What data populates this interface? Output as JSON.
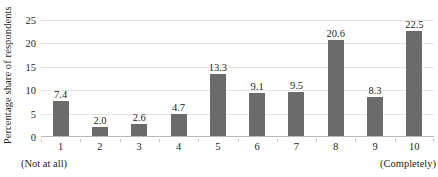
{
  "chart_data": {
    "type": "bar",
    "title": "",
    "subtitle": "",
    "xlabel": "",
    "ylabel": "Percentage share of respondents",
    "categories": [
      "1",
      "2",
      "3",
      "4",
      "5",
      "6",
      "7",
      "8",
      "9",
      "10"
    ],
    "values": [
      7.4,
      2.0,
      2.6,
      4.7,
      13.3,
      9.1,
      9.5,
      20.6,
      8.3,
      22.5
    ],
    "data_labels": [
      "7.4",
      "2.0",
      "2.6",
      "4.7",
      "13.3",
      "9.1",
      "9.5",
      "20.6",
      "8.3",
      "22.5"
    ],
    "ylim": [
      0,
      25
    ],
    "ytick_labels": [
      "0",
      "5",
      "10",
      "15",
      "20",
      "25"
    ],
    "ytick_values": [
      0,
      5,
      10,
      15,
      20,
      25
    ],
    "grid": true,
    "grid_axis": "y",
    "legend": false,
    "legend_position": "none",
    "axis_endpoint_labels": {
      "low": "(Not at all)",
      "high": "(Completely)"
    },
    "colors": {
      "bar": "#6b6b6b",
      "gridline": "#e4e4e4",
      "axis": "#b9b9b9",
      "text": "#231f20",
      "background": "#ffffff"
    }
  }
}
